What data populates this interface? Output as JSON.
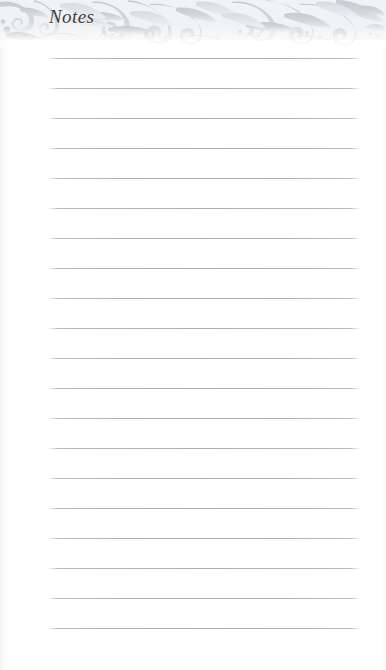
{
  "page": {
    "title": "Notes",
    "background_color": "#ffffff",
    "width": 386,
    "height": 670
  },
  "ornament": {
    "name": "baroque-acanthus-scrollwork",
    "description": "ornate floral scroll band across top of page",
    "fill_color": "#d5d8dc",
    "accent_color": "#c5c9ce",
    "band_height": 48
  },
  "rules": {
    "line_color": "#aaaeb5",
    "left": 48,
    "right": 360,
    "first_line_y": 58,
    "spacing": 30,
    "count": 20,
    "values": [
      "",
      "",
      "",
      "",
      "",
      "",
      "",
      "",
      "",
      "",
      "",
      "",
      "",
      "",
      "",
      "",
      "",
      "",
      "",
      ""
    ]
  }
}
